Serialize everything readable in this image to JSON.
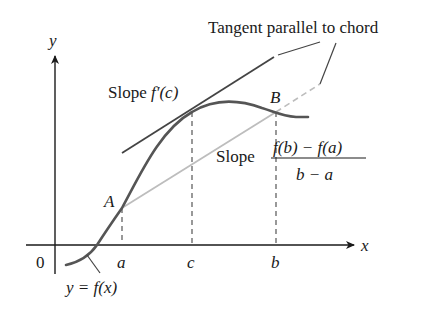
{
  "figure": {
    "labels": {
      "y_axis": "y",
      "x_axis": "x",
      "origin": "0",
      "tick_a": "a",
      "tick_c": "c",
      "tick_b": "b",
      "point_A": "A",
      "point_B": "B",
      "tangent_callout": "Tangent parallel to chord",
      "slope_tangent_prefix": "Slope ",
      "slope_tangent_expr": "f′(c)",
      "slope_chord_prefix": "Slope",
      "slope_chord_numerator": "f(b) − f(a)",
      "slope_chord_denominator": "b − a",
      "curve_label": "y = f(x)"
    },
    "colors": {
      "curve": "#555555",
      "tangent": "#444444",
      "chord": "#bdbdbd",
      "axes": "#1a1a1a",
      "dashes": "#555555"
    }
  }
}
